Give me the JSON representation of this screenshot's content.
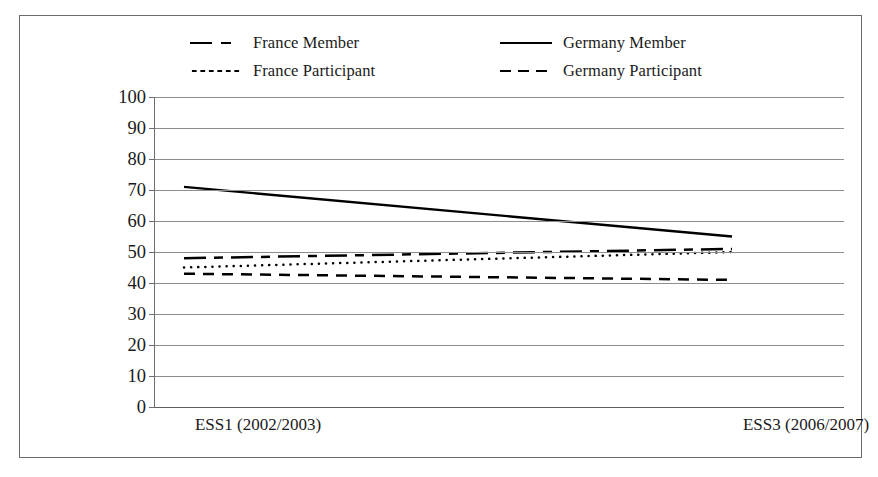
{
  "chart_data": {
    "type": "line",
    "title": "",
    "xlabel": "",
    "ylabel": "",
    "ylim": [
      0,
      100
    ],
    "yticks": [
      100,
      90,
      80,
      70,
      60,
      50,
      40,
      30,
      20,
      10,
      0
    ],
    "grid": true,
    "legend_position": "top",
    "categories": [
      "ESS1 (2002/2003)",
      "ESS3 (2006/2007)"
    ],
    "series": [
      {
        "name": "France Member",
        "values": [
          48,
          51
        ],
        "style": "dash-dot",
        "color": "#000000"
      },
      {
        "name": "Germany Member",
        "values": [
          71,
          55
        ],
        "style": "solid",
        "color": "#000000"
      },
      {
        "name": "France Participant",
        "values": [
          45,
          50
        ],
        "style": "dotted",
        "color": "#000000"
      },
      {
        "name": "Germany Participant",
        "values": [
          43,
          41
        ],
        "style": "dashed",
        "color": "#000000"
      }
    ]
  },
  "legend": {
    "items": [
      {
        "label": "France Member",
        "sample": "dash-dot-line-icon"
      },
      {
        "label": "Germany Member",
        "sample": "solid-line-icon"
      },
      {
        "label": "France Participant",
        "sample": "dotted-line-icon"
      },
      {
        "label": "Germany Participant",
        "sample": "dashed-line-icon"
      }
    ]
  },
  "axis": {
    "y_ticks": [
      "100",
      "90",
      "80",
      "70",
      "60",
      "50",
      "40",
      "30",
      "20",
      "10",
      "0"
    ],
    "x_ticks": [
      "ESS1 (2002/2003)",
      "ESS3 (2006/2007)"
    ]
  }
}
